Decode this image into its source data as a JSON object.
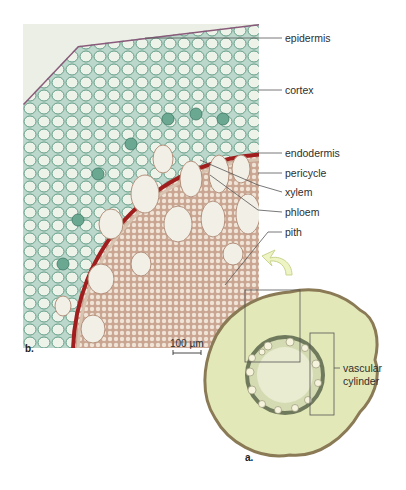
{
  "figure": {
    "type": "plant root cross-section micrograph",
    "panels": [
      {
        "id": "b",
        "letter": "b.",
        "description": "magnified micrograph of root tissues"
      },
      {
        "id": "a",
        "letter": "a.",
        "description": "whole root cross-section"
      }
    ],
    "labels": [
      {
        "id": "epidermis",
        "text": "epidermis"
      },
      {
        "id": "cortex",
        "text": "cortex"
      },
      {
        "id": "endodermis",
        "text": "endodermis"
      },
      {
        "id": "pericycle",
        "text": "pericycle"
      },
      {
        "id": "xylem",
        "text": "xylem"
      },
      {
        "id": "phloem",
        "text": "phloem"
      },
      {
        "id": "pith",
        "text": "pith"
      },
      {
        "id": "vascular_cylinder",
        "line1": "vascular",
        "line2": "cylinder"
      }
    ],
    "scale_bar": {
      "text": "100 µm"
    },
    "colors": {
      "cortex_cells": "#8fbfae",
      "cortex_bg": "#cfe3d6",
      "endodermis": "#a01e1e",
      "stele": "#d9b9a6",
      "cross_section": "#e3e8b8",
      "cross_section_rim": "#8a7a55",
      "arrow": "#eef4c4",
      "leader_line": "#555555"
    }
  }
}
